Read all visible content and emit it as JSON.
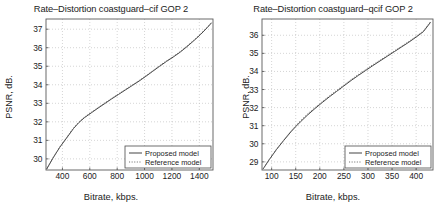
{
  "figure": {
    "panels": [
      "left",
      "right"
    ]
  },
  "chart_data": [
    {
      "type": "line",
      "title": "Rate–Distortion coastguard–cif GOP 2",
      "xlabel": "Bitrate, kbps.",
      "ylabel": "PSNR, dB.",
      "xlim": [
        280,
        1500
      ],
      "ylim": [
        29.4,
        37.55
      ],
      "xticks": [
        400,
        600,
        800,
        1000,
        1200,
        1400
      ],
      "yticks": [
        30,
        31,
        32,
        33,
        34,
        35,
        36,
        37
      ],
      "xticklabels": [
        "400",
        "600",
        "800",
        "1000",
        "1200",
        "1400"
      ],
      "yticklabels": [
        "30",
        "31",
        "32",
        "33",
        "34",
        "35",
        "36",
        "37"
      ],
      "grid": true,
      "legend_position": "lower right",
      "series": [
        {
          "name": "Proposed model",
          "style": "solid",
          "color": "#3a3a3a",
          "x": [
            285,
            330,
            380,
            430,
            480,
            520,
            560,
            610,
            660,
            710,
            760,
            810,
            860,
            910,
            960,
            1010,
            1060,
            1110,
            1160,
            1210,
            1260,
            1310,
            1360,
            1410,
            1460,
            1490
          ],
          "y": [
            29.45,
            30.03,
            30.62,
            31.12,
            31.63,
            31.96,
            32.22,
            32.48,
            32.74,
            32.99,
            33.24,
            33.48,
            33.72,
            33.96,
            34.2,
            34.46,
            34.73,
            35.0,
            35.26,
            35.5,
            35.76,
            36.06,
            36.38,
            36.72,
            37.1,
            37.35
          ]
        },
        {
          "name": "Reference model",
          "style": "dotted",
          "color": "#6d6d6d",
          "x": [
            285,
            330,
            380,
            430,
            480,
            520,
            560,
            610,
            660,
            710,
            760,
            810,
            860,
            910,
            960,
            1010,
            1060,
            1110,
            1160,
            1210,
            1260,
            1310,
            1360,
            1410,
            1460,
            1490
          ],
          "y": [
            29.45,
            30.05,
            30.64,
            31.15,
            31.66,
            31.99,
            32.25,
            32.51,
            32.77,
            33.02,
            33.27,
            33.51,
            33.75,
            33.99,
            34.23,
            34.49,
            34.76,
            35.03,
            35.29,
            35.53,
            35.79,
            36.09,
            36.41,
            36.75,
            37.13,
            37.38
          ]
        }
      ]
    },
    {
      "type": "line",
      "title": "Rate–Distortion coastguard–qcif GOP 2",
      "xlabel": "Bitrate, kbps.",
      "ylabel": "PSNR, dB.",
      "xlim": [
        80,
        435
      ],
      "ylim": [
        28.55,
        36.9
      ],
      "xticks": [
        100,
        150,
        200,
        250,
        300,
        350,
        400
      ],
      "yticks": [
        29,
        30,
        31,
        32,
        33,
        34,
        35,
        36
      ],
      "xticklabels": [
        "100",
        "150",
        "200",
        "250",
        "300",
        "350",
        "400"
      ],
      "yticklabels": [
        "29",
        "30",
        "31",
        "32",
        "33",
        "34",
        "35",
        "36"
      ],
      "grid": true,
      "legend_position": "lower right",
      "series": [
        {
          "name": "Proposed model",
          "style": "solid",
          "color": "#3a3a3a",
          "x": [
            82,
            95,
            110,
            125,
            140,
            150,
            160,
            175,
            190,
            205,
            220,
            235,
            250,
            265,
            280,
            295,
            310,
            325,
            340,
            355,
            370,
            385,
            400,
            415,
            430
          ],
          "y": [
            28.6,
            29.12,
            29.68,
            30.18,
            30.66,
            30.95,
            31.22,
            31.6,
            31.95,
            32.28,
            32.6,
            32.9,
            33.2,
            33.5,
            33.78,
            34.05,
            34.32,
            34.58,
            34.84,
            35.1,
            35.36,
            35.62,
            35.9,
            36.2,
            36.72
          ]
        },
        {
          "name": "Reference model",
          "style": "dotted",
          "color": "#6d6d6d",
          "x": [
            82,
            95,
            110,
            125,
            140,
            150,
            160,
            175,
            190,
            205,
            220,
            235,
            250,
            265,
            280,
            295,
            310,
            325,
            340,
            355,
            370,
            385,
            400,
            415,
            430
          ],
          "y": [
            28.6,
            29.14,
            29.7,
            30.21,
            30.7,
            30.99,
            31.28,
            31.66,
            32.0,
            32.33,
            32.65,
            32.95,
            33.25,
            33.55,
            33.83,
            34.1,
            34.37,
            34.62,
            34.88,
            35.14,
            35.4,
            35.66,
            35.94,
            36.24,
            36.76
          ]
        }
      ]
    }
  ]
}
